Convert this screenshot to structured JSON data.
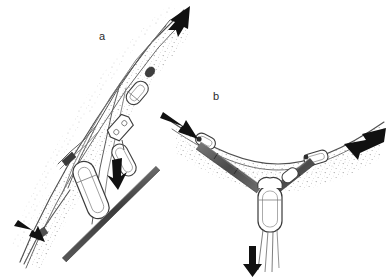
{
  "figure": {
    "type": "technical-line-illustration",
    "background_color": "#ffffff",
    "ink_color": "#1a1a1a",
    "line_color": "#4a4a4a",
    "stipple_color": "#9a9a9a",
    "shade_color": "#6e6e6e",
    "width": 386,
    "height": 280
  },
  "panels": [
    {
      "id": "a",
      "label": "a",
      "label_x": 99,
      "label_y": 31,
      "caption": "Diagonal rope anchor with inline hardware",
      "orientation": "diagonal-up-right",
      "arrows": [
        {
          "name": "load-arrow-top-right",
          "direction": "up-right",
          "x": 176,
          "y": 14
        },
        {
          "name": "load-arrow-middle",
          "direction": "down-right",
          "x": 117,
          "y": 174
        },
        {
          "name": "load-arrow-bottom-left",
          "direction": "up-left",
          "x": 24,
          "y": 230
        }
      ],
      "elements": [
        {
          "name": "main-rope",
          "kind": "rope"
        },
        {
          "name": "secondary-rope",
          "kind": "rope"
        },
        {
          "name": "stipple-band",
          "kind": "texture"
        },
        {
          "name": "carabiner-upper",
          "kind": "hardware"
        },
        {
          "name": "carabiner-lower",
          "kind": "hardware"
        },
        {
          "name": "pulley-block",
          "kind": "hardware"
        },
        {
          "name": "dark-bar",
          "kind": "pole"
        }
      ]
    },
    {
      "id": "b",
      "label": "b",
      "label_x": 213,
      "label_y": 91,
      "caption": "V-shaped two-point equalized anchor",
      "orientation": "v-shaped",
      "arrows": [
        {
          "name": "load-arrow-left",
          "direction": "down-left",
          "x": 168,
          "y": 121
        },
        {
          "name": "load-arrow-right",
          "direction": "down-left",
          "x": 356,
          "y": 133
        },
        {
          "name": "load-arrow-bottom",
          "direction": "down",
          "x": 252,
          "y": 252
        }
      ],
      "elements": [
        {
          "name": "horizontal-rope",
          "kind": "rope"
        },
        {
          "name": "stipple-band",
          "kind": "texture"
        },
        {
          "name": "left-sling-leg",
          "kind": "sling"
        },
        {
          "name": "right-sling-leg",
          "kind": "sling"
        },
        {
          "name": "left-anchor-hardware",
          "kind": "hardware"
        },
        {
          "name": "right-anchor-hardware",
          "kind": "hardware"
        },
        {
          "name": "master-point-carabiner",
          "kind": "hardware"
        },
        {
          "name": "hanging-strands",
          "kind": "rope"
        }
      ]
    }
  ]
}
